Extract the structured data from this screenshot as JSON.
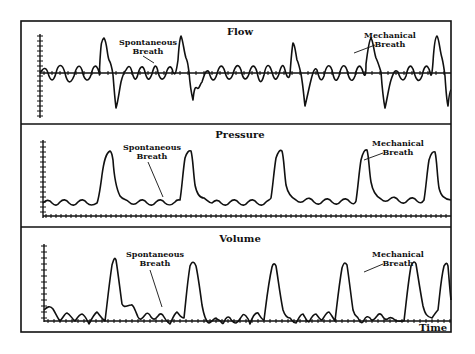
{
  "figure": {
    "panels": [
      {
        "id": "flow",
        "title": "Flow",
        "annotations": [
          {
            "line1": "Spontaneous",
            "line2": "Breath"
          },
          {
            "line1": "Mechanical",
            "line2": "Breath"
          }
        ]
      },
      {
        "id": "pressure",
        "title": "Pressure",
        "annotations": [
          {
            "line1": "Spontaneous",
            "line2": "Breath"
          },
          {
            "line1": "Mechanical",
            "line2": "Breath"
          }
        ]
      },
      {
        "id": "volume",
        "title": "Volume",
        "annotations": [
          {
            "line1": "Spontaneous",
            "line2": "Breath"
          },
          {
            "line1": "Mechanical",
            "line2": "Breath"
          }
        ]
      }
    ],
    "x_axis_label": "Time",
    "colors": {
      "line": "#111111",
      "background": "#ffffff"
    }
  }
}
